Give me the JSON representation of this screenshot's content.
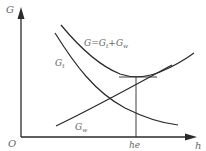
{
  "diagram": {
    "type": "economic-optimum-curves",
    "axes": {
      "y_label": "G",
      "x_label": "h",
      "origin_label": "O"
    },
    "curves": [
      {
        "id": "total",
        "label_main": "G=G",
        "label_sub1": "t",
        "label_mid": "+G",
        "label_sub2": "w",
        "shape": "U-shaped"
      },
      {
        "id": "gt",
        "label_main": "G",
        "label_sub": "t",
        "shape": "decreasing"
      },
      {
        "id": "gw",
        "label_main": "G",
        "label_sub": "w",
        "shape": "increasing"
      }
    ],
    "optimum": {
      "x_label": "he",
      "description": "minimum of total curve; vertical drop line to h-axis"
    },
    "colors": {
      "line": "#2a2a2a",
      "text": "#666666",
      "background": "#ffffff"
    }
  }
}
